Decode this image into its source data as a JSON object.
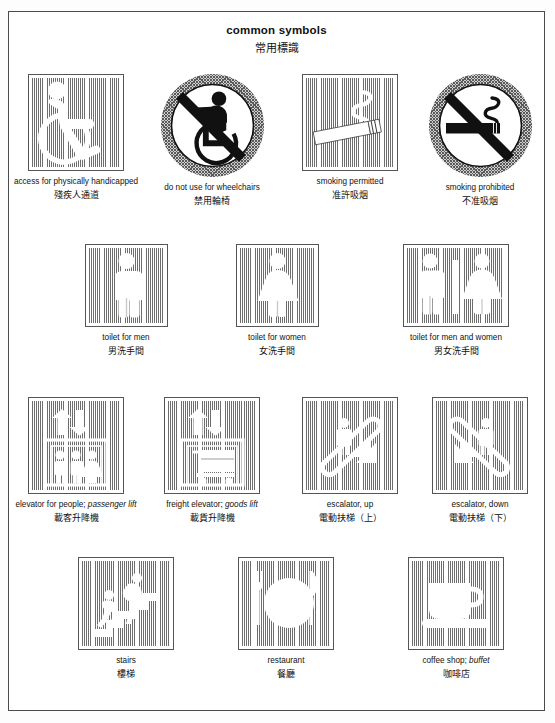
{
  "page": {
    "title_en": "common symbols",
    "title_zh": "常用標識"
  },
  "rows": [
    {
      "items": [
        {
          "name": "access-for-physically-handicapped",
          "icon": "wheelchair-accessible-icon",
          "shape": "square",
          "label_en": "access for physically handicapped",
          "label_en_italic": "",
          "label_zh": "殘疾人通道"
        },
        {
          "name": "do-not-use-for-wheelchairs",
          "icon": "no-wheelchair-icon",
          "shape": "circle",
          "label_en": "do not use for wheelchairs",
          "label_en_italic": "",
          "label_zh": "禁用輪椅"
        },
        {
          "name": "smoking-permitted",
          "icon": "cigarette-icon",
          "shape": "square",
          "label_en": "smoking permitted",
          "label_en_italic": "",
          "label_zh": "准許吸烟"
        },
        {
          "name": "smoking-prohibited",
          "icon": "no-smoking-icon",
          "shape": "circle",
          "label_en": "smoking prohibited",
          "label_en_italic": "",
          "label_zh": "不准吸烟"
        }
      ]
    },
    {
      "items": [
        {
          "name": "toilet-for-men",
          "icon": "male-figure-icon",
          "shape": "square",
          "label_en": "toilet for men",
          "label_en_italic": "",
          "label_zh": "男洗手間"
        },
        {
          "name": "toilet-for-women",
          "icon": "female-figure-icon",
          "shape": "square",
          "label_en": "toilet for women",
          "label_en_italic": "",
          "label_zh": "女洗手間"
        },
        {
          "name": "toilet-for-men-and-women",
          "icon": "male-female-figures-icon",
          "shape": "square-wide",
          "label_en": "toilet for men and women",
          "label_en_italic": "",
          "label_zh": "男女洗手間"
        }
      ]
    },
    {
      "items": [
        {
          "name": "elevator-for-people",
          "icon": "passenger-elevator-icon",
          "shape": "square",
          "label_en": "elevator for people; ",
          "label_en_italic": "passenger lift",
          "label_zh": "載客升降機"
        },
        {
          "name": "freight-elevator",
          "icon": "freight-elevator-icon",
          "shape": "square",
          "label_en": "freight elevator; ",
          "label_en_italic": "goods lift",
          "label_zh": "載貨升降機"
        },
        {
          "name": "escalator-up",
          "icon": "escalator-up-icon",
          "shape": "square",
          "label_en": "escalator, up",
          "label_en_italic": "",
          "label_zh": "電動扶梯（上）"
        },
        {
          "name": "escalator-down",
          "icon": "escalator-down-icon",
          "shape": "square",
          "label_en": "escalator, down",
          "label_en_italic": "",
          "label_zh": "電動扶梯（下）"
        }
      ]
    },
    {
      "items": [
        {
          "name": "stairs",
          "icon": "stairs-icon",
          "shape": "square",
          "label_en": "stairs",
          "label_en_italic": "",
          "label_zh": "樓梯"
        },
        {
          "name": "restaurant",
          "icon": "fork-plate-knife-icon",
          "shape": "square",
          "label_en": "restaurant",
          "label_en_italic": "",
          "label_zh": "餐廳"
        },
        {
          "name": "coffee-shop",
          "icon": "coffee-cup-icon",
          "shape": "square",
          "label_en": "coffee shop; ",
          "label_en_italic": "buffet",
          "label_zh": "咖啡店"
        }
      ]
    }
  ],
  "colors": {
    "hatch_line": "#6d6d6d",
    "plate_border": "#4b4b4b",
    "symbol_white": "#ffffff",
    "symbol_black": "#111111"
  }
}
